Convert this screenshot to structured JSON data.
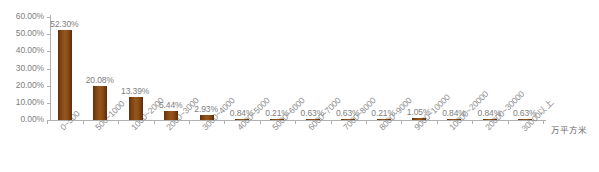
{
  "chart_data": {
    "type": "bar",
    "title": "",
    "subtitle": "",
    "xlabel": "万平方米",
    "ylabel": "",
    "ylim": [
      0,
      60
    ],
    "grid": false,
    "legend": "none",
    "y_ticks": [
      "60.00%",
      "50.00%",
      "40.00%",
      "30.00%",
      "20.00%",
      "10.00%",
      "0.00%"
    ],
    "y_tick_values": [
      60,
      50,
      40,
      30,
      20,
      10,
      0
    ],
    "categories": [
      "0~500",
      "500~1000",
      "1000~2000",
      "2000~3000",
      "3000~4000",
      "4000~5000",
      "5000~6000",
      "6000~7000",
      "7000~8000",
      "8000~9000",
      "9000~10000",
      "10000~20000",
      "20000~30000",
      "30000以上"
    ],
    "values": [
      52.3,
      20.08,
      13.39,
      5.44,
      2.93,
      0.84,
      0.21,
      0.63,
      0.63,
      0.21,
      1.05,
      0.84,
      0.84,
      0.63
    ],
    "value_labels": [
      "52.30%",
      "20.08%",
      "13.39%",
      "5.44%",
      "2.93%",
      "0.84%",
      "0.21%",
      "0.63%",
      "0.63%",
      "0.21%",
      "1.05%",
      "0.84%",
      "0.84%",
      "0.63%"
    ],
    "colors": {
      "bar": "#8B4513",
      "bar_dark": "#5f2f0b",
      "bar_light": "#96561c",
      "axis": "#b0b0b0",
      "text": "#808080",
      "background": "#ffffff"
    }
  }
}
